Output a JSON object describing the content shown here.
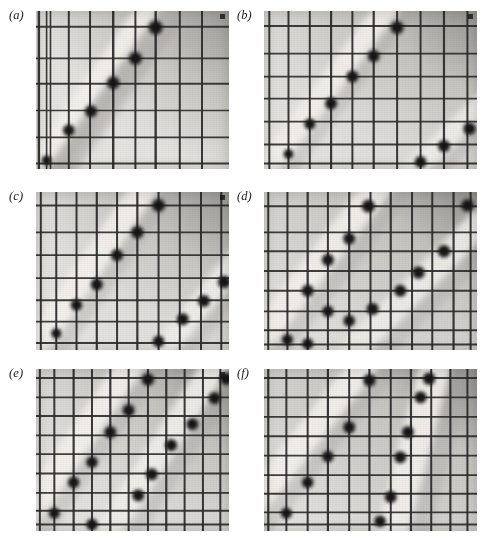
{
  "figure": {
    "background_color": "#ffffff",
    "width": 482,
    "height": 544,
    "columns": 2,
    "rows": 3,
    "label_style": "italic-serif-parenthesized"
  },
  "style_colors": {
    "page_background": "#ffffff",
    "plate_light": "#e9e7e3",
    "plate_mid": "#cfcdc8",
    "plate_dark": "#a9a7a3",
    "plate_darkest": "#8e8c88",
    "band_bright": "#f4f2ee",
    "grid_line": "#2b2b2b",
    "grid_line_soft": "#4a4a4a",
    "blob_color": "#171717",
    "label_color": "#1a1a1a"
  },
  "panels": [
    {
      "id": "a",
      "label": "(a)",
      "x": 36,
      "y": 11,
      "width": 193,
      "height": 158,
      "corner_mark": true,
      "shading": {
        "base": "#e4e2de",
        "corner_dark": "#b4b2ae",
        "dark_side": "right-top"
      },
      "bands": [
        {
          "name": "primary-bright-band",
          "x1": -0.04,
          "y1": 1.08,
          "x2": 0.62,
          "y2": -0.06,
          "width": 0.085,
          "brightness": "#f3f1ed"
        },
        {
          "name": "shadow-band",
          "x1": 0.02,
          "y1": 1.14,
          "x2": 0.68,
          "y2": 0.0,
          "width": 0.055,
          "brightness": "#b8b6b2"
        }
      ],
      "grid": {
        "vertical": [
          0.015,
          0.055,
          0.075,
          0.17,
          0.28,
          0.4,
          0.515,
          0.62,
          0.745,
          0.86
        ],
        "horizontal": [
          0.1,
          0.3,
          0.46,
          0.63,
          0.8,
          0.965
        ],
        "vertical_weights": [
          2.4,
          1.6,
          1.6,
          2.0,
          2.0,
          2.4,
          2.0,
          2.4,
          2.0,
          2.0
        ],
        "horizontal_weights": [
          2.0,
          1.6,
          2.0,
          1.6,
          1.6,
          2.0
        ]
      },
      "blobs": [
        {
          "x": 0.055,
          "y": 0.945,
          "r": 4.2
        },
        {
          "x": 0.17,
          "y": 0.755,
          "r": 5.0
        },
        {
          "x": 0.285,
          "y": 0.635,
          "r": 5.2
        },
        {
          "x": 0.4,
          "y": 0.455,
          "r": 5.4
        },
        {
          "x": 0.515,
          "y": 0.3,
          "r": 5.6
        },
        {
          "x": 0.62,
          "y": 0.105,
          "r": 6.0
        }
      ],
      "blob_count": 6
    },
    {
      "id": "b",
      "label": "(b)",
      "x": 264,
      "y": 11,
      "width": 213,
      "height": 158,
      "corner_mark": true,
      "shading": {
        "base": "#dddbd7",
        "corner_dark": "#a6a4a0",
        "dark_side": "right-top"
      },
      "bands": [
        {
          "name": "primary-bright-band",
          "x1": -0.02,
          "y1": 1.05,
          "x2": 0.6,
          "y2": -0.06,
          "width": 0.075,
          "brightness": "#f2f0ec"
        },
        {
          "name": "secondary-bright-band",
          "x1": 0.6,
          "y1": 1.14,
          "x2": 1.06,
          "y2": 0.54,
          "width": 0.07,
          "brightness": "#efedE9"
        }
      ],
      "grid": {
        "vertical": [
          0.025,
          0.115,
          0.215,
          0.315,
          0.415,
          0.515,
          0.625,
          0.735,
          0.845,
          0.955
        ],
        "horizontal": [
          0.095,
          0.27,
          0.415,
          0.555,
          0.7,
          0.845,
          0.965
        ],
        "vertical_weights": [
          2.0,
          2.0,
          2.0,
          2.2,
          2.0,
          2.2,
          2.0,
          2.0,
          2.2,
          2.0
        ],
        "horizontal_weights": [
          2.0,
          1.8,
          1.8,
          1.8,
          1.8,
          1.8,
          2.0
        ]
      },
      "blobs": [
        {
          "x": 0.115,
          "y": 0.905,
          "r": 4.2
        },
        {
          "x": 0.215,
          "y": 0.715,
          "r": 4.8
        },
        {
          "x": 0.315,
          "y": 0.585,
          "r": 5.2
        },
        {
          "x": 0.415,
          "y": 0.415,
          "r": 5.2
        },
        {
          "x": 0.515,
          "y": 0.285,
          "r": 5.2
        },
        {
          "x": 0.625,
          "y": 0.105,
          "r": 5.6
        },
        {
          "x": 0.735,
          "y": 0.955,
          "r": 5.0
        },
        {
          "x": 0.845,
          "y": 0.855,
          "r": 5.2
        },
        {
          "x": 0.965,
          "y": 0.745,
          "r": 5.4
        }
      ],
      "blob_count": 9
    },
    {
      "id": "c",
      "label": "(c)",
      "x": 36,
      "y": 192,
      "width": 193,
      "height": 158,
      "corner_mark": true,
      "shading": {
        "base": "#e0dedA",
        "corner_dark": "#adaba7",
        "dark_side": "right-top"
      },
      "bands": [
        {
          "name": "primary-bright-band",
          "x1": -0.03,
          "y1": 1.02,
          "x2": 0.58,
          "y2": -0.06,
          "width": 0.085,
          "brightness": "#f3f1ed"
        },
        {
          "name": "secondary-bright-band",
          "x1": 0.58,
          "y1": 1.12,
          "x2": 1.06,
          "y2": 0.4,
          "width": 0.075,
          "brightness": "#f0eeea"
        }
      ],
      "grid": {
        "vertical": [
          0.025,
          0.105,
          0.21,
          0.315,
          0.42,
          0.525,
          0.635,
          0.745,
          0.855,
          0.96
        ],
        "horizontal": [
          0.085,
          0.255,
          0.4,
          0.545,
          0.685,
          0.82,
          0.955
        ],
        "vertical_weights": [
          2.0,
          2.0,
          2.0,
          2.2,
          2.0,
          2.2,
          2.0,
          2.0,
          2.0,
          2.0
        ],
        "horizontal_weights": [
          2.0,
          1.8,
          1.8,
          1.8,
          1.8,
          1.8,
          2.0
        ]
      },
      "blobs": [
        {
          "x": 0.105,
          "y": 0.895,
          "r": 4.4
        },
        {
          "x": 0.21,
          "y": 0.715,
          "r": 5.0
        },
        {
          "x": 0.315,
          "y": 0.585,
          "r": 5.2
        },
        {
          "x": 0.42,
          "y": 0.4,
          "r": 5.2
        },
        {
          "x": 0.525,
          "y": 0.255,
          "r": 5.4
        },
        {
          "x": 0.635,
          "y": 0.085,
          "r": 5.6
        },
        {
          "x": 0.635,
          "y": 0.945,
          "r": 5.0
        },
        {
          "x": 0.76,
          "y": 0.805,
          "r": 5.2
        },
        {
          "x": 0.87,
          "y": 0.69,
          "r": 5.2
        },
        {
          "x": 0.975,
          "y": 0.57,
          "r": 5.4
        }
      ],
      "blob_count": 10
    },
    {
      "id": "d",
      "label": "(d)",
      "x": 264,
      "y": 192,
      "width": 213,
      "height": 158,
      "corner_mark": false,
      "shading": {
        "base": "#d6d4d0",
        "corner_dark": "#9c9a96",
        "dark_side": "right-top"
      },
      "bands": [
        {
          "name": "primary-bright-band",
          "x1": -0.06,
          "y1": 1.0,
          "x2": 0.56,
          "y2": -0.08,
          "width": 0.09,
          "brightness": "#f2f0ec"
        },
        {
          "name": "secondary-bright-band",
          "x1": 0.3,
          "y1": 1.16,
          "x2": 1.04,
          "y2": 0.16,
          "width": 0.085,
          "brightness": "#efedE9"
        }
      ],
      "grid": {
        "vertical": [
          0.02,
          0.11,
          0.205,
          0.3,
          0.4,
          0.5,
          0.595,
          0.695,
          0.79,
          0.89,
          0.97
        ],
        "horizontal": [
          0.09,
          0.255,
          0.375,
          0.5,
          0.625,
          0.755,
          0.875,
          0.965
        ],
        "vertical_weights": [
          2.0,
          2.0,
          2.2,
          2.0,
          2.2,
          2.0,
          2.2,
          2.0,
          2.0,
          2.2,
          2.0
        ],
        "horizontal_weights": [
          2.0,
          1.8,
          1.8,
          1.8,
          1.8,
          1.8,
          1.8,
          2.0
        ]
      },
      "blobs": [
        {
          "x": 0.11,
          "y": 0.935,
          "r": 4.8
        },
        {
          "x": 0.205,
          "y": 0.96,
          "r": 4.8
        },
        {
          "x": 0.3,
          "y": 0.755,
          "r": 5.0
        },
        {
          "x": 0.4,
          "y": 0.815,
          "r": 5.0
        },
        {
          "x": 0.205,
          "y": 0.625,
          "r": 5.2
        },
        {
          "x": 0.3,
          "y": 0.43,
          "r": 5.2
        },
        {
          "x": 0.4,
          "y": 0.295,
          "r": 5.2
        },
        {
          "x": 0.49,
          "y": 0.09,
          "r": 5.6
        },
        {
          "x": 0.51,
          "y": 0.74,
          "r": 5.2
        },
        {
          "x": 0.64,
          "y": 0.625,
          "r": 5.2
        },
        {
          "x": 0.725,
          "y": 0.51,
          "r": 5.4
        },
        {
          "x": 0.845,
          "y": 0.375,
          "r": 5.4
        },
        {
          "x": 0.955,
          "y": 0.085,
          "r": 5.4
        }
      ],
      "blob_count": 13
    },
    {
      "id": "e",
      "label": "(e)",
      "x": 36,
      "y": 369,
      "width": 193,
      "height": 162,
      "corner_mark": true,
      "shading": {
        "base": "#dcdad6",
        "corner_dark": "#a4a29e",
        "dark_side": "right-top"
      },
      "bands": [
        {
          "name": "primary-bright-band",
          "x1": -0.08,
          "y1": 0.96,
          "x2": 0.52,
          "y2": -0.08,
          "width": 0.085,
          "brightness": "#f3f1ed"
        },
        {
          "name": "secondary-bright-band",
          "x1": 0.32,
          "y1": 1.1,
          "x2": 0.96,
          "y2": -0.08,
          "width": 0.085,
          "brightness": "#f1efeb"
        }
      ],
      "grid": {
        "vertical": [
          0.02,
          0.095,
          0.195,
          0.29,
          0.385,
          0.48,
          0.58,
          0.675,
          0.77,
          0.865,
          0.955
        ],
        "horizontal": [
          0.055,
          0.175,
          0.29,
          0.41,
          0.525,
          0.645,
          0.765,
          0.875,
          0.96
        ],
        "vertical_weights": [
          2.0,
          2.0,
          2.2,
          2.0,
          2.2,
          2.0,
          2.0,
          2.2,
          2.0,
          2.0,
          2.0
        ],
        "horizontal_weights": [
          2.0,
          1.8,
          1.8,
          1.8,
          1.8,
          1.8,
          1.8,
          1.8,
          2.0
        ]
      },
      "blobs": [
        {
          "x": 0.095,
          "y": 0.89,
          "r": 4.8
        },
        {
          "x": 0.195,
          "y": 0.7,
          "r": 5.0
        },
        {
          "x": 0.29,
          "y": 0.575,
          "r": 5.0
        },
        {
          "x": 0.385,
          "y": 0.39,
          "r": 5.2
        },
        {
          "x": 0.48,
          "y": 0.255,
          "r": 5.2
        },
        {
          "x": 0.58,
          "y": 0.065,
          "r": 5.4
        },
        {
          "x": 0.29,
          "y": 0.96,
          "r": 5.0
        },
        {
          "x": 0.53,
          "y": 0.78,
          "r": 5.2
        },
        {
          "x": 0.6,
          "y": 0.65,
          "r": 5.2
        },
        {
          "x": 0.7,
          "y": 0.47,
          "r": 5.2
        },
        {
          "x": 0.81,
          "y": 0.34,
          "r": 5.2
        },
        {
          "x": 0.925,
          "y": 0.18,
          "r": 5.2
        },
        {
          "x": 0.985,
          "y": 0.06,
          "r": 5.4
        }
      ],
      "blob_count": 13
    },
    {
      "id": "f",
      "label": "(f)",
      "x": 264,
      "y": 369,
      "width": 213,
      "height": 162,
      "corner_mark": false,
      "shading": {
        "base": "#d4d2ce",
        "corner_dark": "#9a9894",
        "dark_side": "right-top"
      },
      "bands": [
        {
          "name": "primary-bright-band",
          "x1": -0.1,
          "y1": 0.92,
          "x2": 0.5,
          "y2": -0.08,
          "width": 0.085,
          "brightness": "#f3f1ed"
        },
        {
          "name": "steep-bright-band",
          "x1": 0.58,
          "y1": 1.12,
          "x2": 0.82,
          "y2": -0.1,
          "width": 0.1,
          "brightness": "#f2f0ec"
        }
      ],
      "grid": {
        "vertical": [
          0.02,
          0.105,
          0.205,
          0.3,
          0.4,
          0.495,
          0.595,
          0.69,
          0.785,
          0.875,
          0.955
        ],
        "horizontal": [
          0.055,
          0.175,
          0.295,
          0.415,
          0.535,
          0.655,
          0.77,
          0.885,
          0.96
        ],
        "vertical_weights": [
          2.2,
          2.0,
          2.0,
          2.2,
          2.0,
          2.2,
          2.0,
          2.2,
          2.0,
          2.2,
          2.0
        ],
        "horizontal_weights": [
          2.0,
          1.8,
          1.8,
          1.8,
          1.8,
          1.8,
          1.8,
          1.8,
          2.0
        ]
      },
      "blobs": [
        {
          "x": 0.105,
          "y": 0.89,
          "r": 4.8
        },
        {
          "x": 0.205,
          "y": 0.7,
          "r": 5.0
        },
        {
          "x": 0.3,
          "y": 0.54,
          "r": 5.0
        },
        {
          "x": 0.4,
          "y": 0.36,
          "r": 5.2
        },
        {
          "x": 0.495,
          "y": 0.07,
          "r": 5.4
        },
        {
          "x": 0.545,
          "y": 0.94,
          "r": 5.0
        },
        {
          "x": 0.595,
          "y": 0.79,
          "r": 5.2
        },
        {
          "x": 0.64,
          "y": 0.545,
          "r": 5.2
        },
        {
          "x": 0.675,
          "y": 0.39,
          "r": 5.2
        },
        {
          "x": 0.735,
          "y": 0.175,
          "r": 5.2
        },
        {
          "x": 0.775,
          "y": 0.06,
          "r": 5.4
        }
      ],
      "blob_count": 11
    }
  ]
}
